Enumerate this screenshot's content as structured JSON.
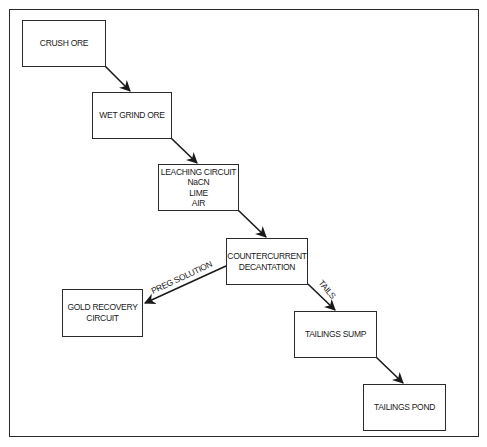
{
  "diagram": {
    "type": "process-flowchart",
    "nodes": [
      {
        "id": "crush-ore",
        "lines": [
          "CRUSH ORE"
        ]
      },
      {
        "id": "wet-grind-ore",
        "lines": [
          "WET GRIND ORE"
        ]
      },
      {
        "id": "leaching-circuit",
        "lines": [
          "LEACHING CIRCUIT",
          "NaCN",
          "LIME",
          "AIR"
        ]
      },
      {
        "id": "countercurrent-decantation",
        "lines": [
          "COUNTERCURRENT",
          "DECANTATION"
        ]
      },
      {
        "id": "gold-recovery-circuit",
        "lines": [
          "GOLD RECOVERY",
          "CIRCUIT"
        ]
      },
      {
        "id": "tailings-sump",
        "lines": [
          "TAILINGS SUMP"
        ]
      },
      {
        "id": "tailings-pond",
        "lines": [
          "TAILINGS POND"
        ]
      }
    ],
    "edges": [
      {
        "from": "crush-ore",
        "to": "wet-grind-ore",
        "label": ""
      },
      {
        "from": "wet-grind-ore",
        "to": "leaching-circuit",
        "label": ""
      },
      {
        "from": "leaching-circuit",
        "to": "countercurrent-decantation",
        "label": ""
      },
      {
        "from": "countercurrent-decantation",
        "to": "gold-recovery-circuit",
        "label": "PREG SOLUTION"
      },
      {
        "from": "countercurrent-decantation",
        "to": "tailings-sump",
        "label": "TAILS"
      },
      {
        "from": "tailings-sump",
        "to": "tailings-pond",
        "label": ""
      }
    ]
  },
  "colors": {
    "line": "#2a2a2a",
    "text": "#1a1a1a",
    "background": "#ffffff"
  }
}
